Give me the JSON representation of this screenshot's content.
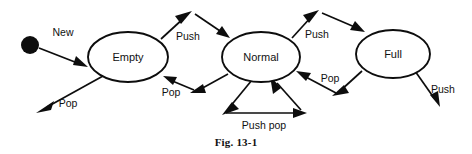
{
  "figure": {
    "caption": "Fig. 13-1",
    "kind": "state-transition-diagram"
  },
  "states": [
    {
      "id": "empty",
      "label": "Empty",
      "cx": 128,
      "cy": 57,
      "rx": 40,
      "ry": 25
    },
    {
      "id": "normal",
      "label": "Normal",
      "cx": 261,
      "cy": 57,
      "rx": 39,
      "ry": 25
    },
    {
      "id": "full",
      "label": "Full",
      "cx": 393,
      "cy": 54,
      "rx": 37,
      "ry": 24
    }
  ],
  "initial": {
    "marker": "filled-circle",
    "cx": 30,
    "cy": 45,
    "r": 9
  },
  "transitions": [
    {
      "id": "new",
      "label": "New",
      "from": "start",
      "to": "empty",
      "label_x": 63,
      "label_y": 33
    },
    {
      "id": "empty-push",
      "label": "Push",
      "from": "empty",
      "to": "normal",
      "label_x": 188,
      "label_y": 37
    },
    {
      "id": "normal-pop",
      "label": "Pop",
      "from": "normal",
      "to": "empty",
      "label_x": 171,
      "label_y": 93
    },
    {
      "id": "normal-push",
      "label": "Push",
      "from": "normal",
      "to": "full",
      "label_x": 317,
      "label_y": 35
    },
    {
      "id": "full-pop",
      "label": "Pop",
      "from": "full",
      "to": "normal",
      "label_x": 330,
      "label_y": 79
    },
    {
      "id": "empty-pop-exit",
      "label": "Pop",
      "from": "empty",
      "to": "exit",
      "label_x": 68,
      "label_y": 104
    },
    {
      "id": "full-push-exit",
      "label": "Push",
      "from": "full",
      "to": "exit",
      "label_x": 443,
      "label_y": 90
    },
    {
      "id": "normal-self",
      "label": "Push pop",
      "from": "normal",
      "to": "normal",
      "label_x": 264,
      "label_y": 126
    }
  ],
  "colors": {
    "ink": "#0d0d0d",
    "background": "#ffffff",
    "text": "#111111"
  }
}
